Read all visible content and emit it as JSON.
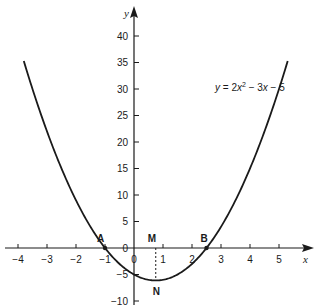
{
  "chart_data": {
    "type": "line",
    "title": "",
    "xlabel": "x",
    "ylabel": "y",
    "equation": {
      "prefix": "y",
      "text_parts": [
        "y",
        " = 2",
        "x",
        "2",
        " − 3",
        "x",
        " − 5"
      ],
      "a": 2,
      "b": -3,
      "c": -5
    },
    "x_ticks": [
      -4,
      -3,
      -2,
      -1,
      0,
      1,
      2,
      3,
      4,
      5
    ],
    "x_tick_labels": [
      "−4",
      "−3",
      "−2",
      "−1",
      "0",
      "1",
      "2",
      "3",
      "4",
      "5"
    ],
    "y_ticks": [
      -10,
      -5,
      0,
      5,
      10,
      15,
      20,
      25,
      30,
      35,
      40
    ],
    "y_tick_labels": [
      "−10",
      "−5",
      "0",
      "5",
      "10",
      "15",
      "20",
      "25",
      "30",
      "35",
      "40"
    ],
    "x_domain_curve": [
      -3.8,
      5.3
    ],
    "xlim": [
      -4.3,
      6.0
    ],
    "ylim": [
      -12,
      45
    ],
    "grid": false,
    "series": [
      {
        "name": "y = 2x^2 - 3x - 5",
        "x": [
          -3.8,
          -3,
          -2,
          -1,
          0,
          0.75,
          1,
          2,
          2.5,
          3,
          4,
          5,
          5.3
        ],
        "y": [
          35.28,
          22,
          9,
          0,
          -5,
          -6.125,
          -6,
          -3,
          0,
          4,
          15,
          30,
          35.28
        ]
      }
    ],
    "annotations": [
      {
        "label": "A",
        "x": -1,
        "y": 0,
        "marker": true
      },
      {
        "label": "B",
        "x": 2.5,
        "y": 0,
        "marker": true
      },
      {
        "label": "M",
        "x": 0.75,
        "y": 0,
        "marker": false
      },
      {
        "label": "N",
        "x": 0.75,
        "y": -6.125,
        "marker": false
      }
    ],
    "dashed_line": {
      "x": 0.75,
      "from_y": 0,
      "to_y": -6.125
    }
  }
}
